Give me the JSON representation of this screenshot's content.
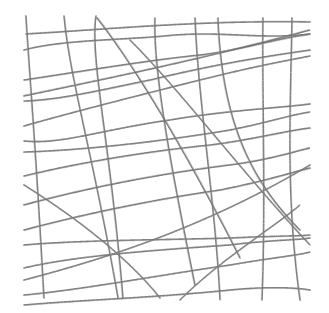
{
  "image": {
    "description": "Pencil-sketch texture of intersecting wavy lines forming an irregular grid on white background",
    "width": 329,
    "height": 313,
    "background": "#ffffff",
    "stroke_color": "#6a6a6a"
  },
  "lines": [
    "M26,16 C30,80 36,150 44,298",
    "M64,16 C70,80 92,150 118,298",
    "M96,16 C90,60 110,140 123,298",
    "M97,18 C130,60 180,140 240,258",
    "M155,18 C153,80 178,200 195,285",
    "M195,18 C198,100 215,200 220,300",
    "M263,18 C262,100 266,200 262,300",
    "M292,18 C290,120 286,200 300,300",
    "M218,18 C222,120 250,180 300,230",
    "M26,34 C100,30 200,20 310,22",
    "M24,50 C60,40 120,40 164,36 C220,30 260,40 310,34",
    "M24,80 C90,70 150,60 200,55 C240,50 270,40 310,34",
    "M24,96 C100,80 200,60 310,30",
    "M24,101 C60,100 100,90 150,80 C200,68 240,60 310,50",
    "M24,126 C80,110 160,90 200,80 C260,65 290,60 310,56",
    "M24,141 C60,145 100,130 170,120 C230,110 280,108 310,104",
    "M24,152 C90,150 170,140 230,130 C270,122 290,115 310,112",
    "M24,176 C90,160 160,150 210,145 C250,140 290,130 310,128",
    "M24,205 C80,190 150,175 230,165 C270,160 300,150 310,148",
    "M24,230 C80,215 150,200 220,190 C270,180 300,170 310,168",
    "M24,245 C80,240 160,240 230,238 C270,236 300,236 310,235",
    "M24,268 C80,255 160,250 230,245 C270,240 300,240 310,238",
    "M24,295 C80,290 160,275 230,265 C270,258 300,255 310,252",
    "M24,305 C80,300 150,298 230,290 C270,286 300,288 310,290",
    "M24,185 C80,220 130,260 160,298",
    "M130,40 C180,90 240,170 310,245",
    "M24,280 C100,260 200,230 310,165",
    "M180,300 C220,260 270,230 300,205"
  ]
}
